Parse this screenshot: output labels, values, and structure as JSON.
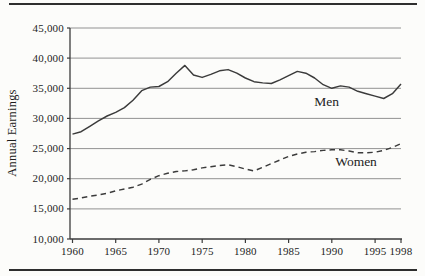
{
  "chart_data": {
    "type": "line",
    "title": "",
    "xlabel": "",
    "ylabel": "Annual Earnings",
    "xlim": [
      1960,
      1998
    ],
    "ylim": [
      10000,
      45000
    ],
    "grid": "horizontal gridlines every 5,000",
    "legend": "inline annotations next to lines",
    "x_ticks": [
      1960,
      1965,
      1970,
      1975,
      1980,
      1985,
      1990,
      1995,
      1998
    ],
    "x_tick_labels": [
      "1960",
      "1965",
      "1970",
      "1975",
      "1980",
      "1985",
      "1990",
      "1995",
      "1998"
    ],
    "y_ticks": [
      10000,
      15000,
      20000,
      25000,
      30000,
      35000,
      40000,
      45000
    ],
    "y_tick_labels": [
      "10,000",
      "15,000",
      "20,000",
      "25,000",
      "30,000",
      "35,000",
      "40,000",
      "45,000"
    ],
    "x": [
      1960,
      1961,
      1962,
      1963,
      1964,
      1965,
      1966,
      1967,
      1968,
      1969,
      1970,
      1971,
      1972,
      1973,
      1974,
      1975,
      1976,
      1977,
      1978,
      1979,
      1980,
      1981,
      1982,
      1983,
      1984,
      1985,
      1986,
      1987,
      1988,
      1989,
      1990,
      1991,
      1992,
      1993,
      1994,
      1995,
      1996,
      1997,
      1998
    ],
    "series": [
      {
        "name": "Men",
        "style": "solid",
        "values": [
          27400,
          27800,
          28700,
          29600,
          30400,
          31000,
          31800,
          33000,
          34600,
          35200,
          35300,
          36100,
          37500,
          38800,
          37200,
          36800,
          37300,
          37900,
          38100,
          37500,
          36700,
          36100,
          35900,
          35800,
          36400,
          37100,
          37800,
          37500,
          36700,
          35600,
          35000,
          35400,
          35200,
          34500,
          34100,
          33700,
          33300,
          34100,
          35700
        ],
        "label_anchor": {
          "x": 1989.4,
          "y": 32100
        }
      },
      {
        "name": "Women",
        "style": "dashed",
        "values": [
          16600,
          16800,
          17100,
          17300,
          17600,
          18000,
          18300,
          18600,
          19100,
          19900,
          20500,
          20900,
          21200,
          21300,
          21500,
          21800,
          22000,
          22200,
          22300,
          22000,
          21600,
          21300,
          21900,
          22500,
          23100,
          23700,
          24100,
          24400,
          24500,
          24700,
          24800,
          24800,
          24600,
          24300,
          24300,
          24400,
          24700,
          25200,
          25800
        ],
        "label_anchor": {
          "x": 1992.8,
          "y": 22050
        }
      }
    ]
  },
  "colors": {
    "line": "#3b3b3b",
    "grid": "#929292",
    "axis": "#3b3b3b",
    "text": "#1c1c1c",
    "rule": "#2e2e2e",
    "background": "#fcfcfa"
  }
}
